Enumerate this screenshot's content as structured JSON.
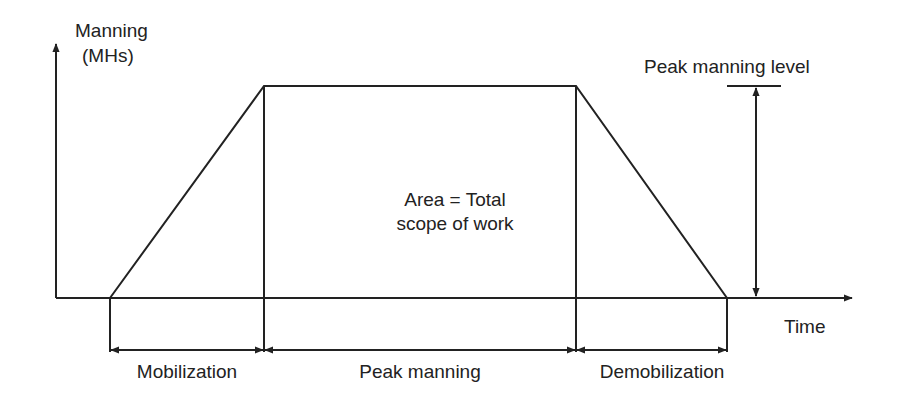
{
  "diagram": {
    "y_axis_label_line1": "Manning",
    "y_axis_label_line2": "(MHs)",
    "x_axis_label": "Time",
    "peak_label": "Peak manning level",
    "area_label_line1": "Area = Total",
    "area_label_line2": "scope of work",
    "phases": [
      {
        "label": "Mobilization"
      },
      {
        "label": "Peak manning"
      },
      {
        "label": "Demobilization"
      }
    ],
    "colors": {
      "line": "#222222",
      "background": "#ffffff"
    }
  }
}
